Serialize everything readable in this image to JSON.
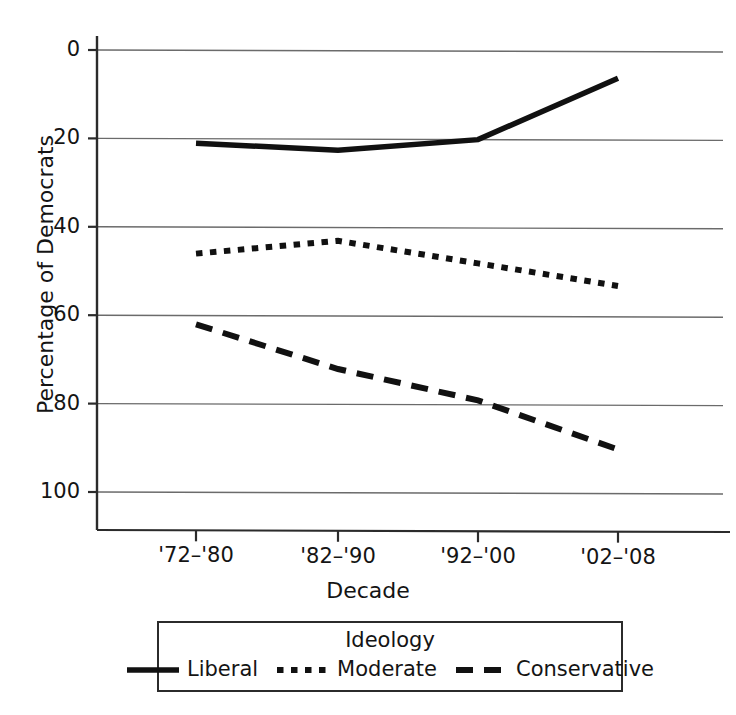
{
  "chart_data": {
    "type": "line",
    "title": "",
    "xlabel": "Decade",
    "ylabel": "Percentage of Democrats",
    "categories": [
      "'72–'80",
      "'82–'90",
      "'92–'00",
      "'02–'08"
    ],
    "ylim": [
      0,
      100
    ],
    "yticks": [
      0,
      20,
      40,
      60,
      80,
      100
    ],
    "ytick_labels": [
      "0",
      "20",
      "40",
      "60",
      "80",
      "100"
    ],
    "grid": "horizontal",
    "legend_position": "below-axis",
    "legend_title": "Ideology",
    "series": [
      {
        "name": "Liberal",
        "style": "solid",
        "color": "#111111",
        "values": [
          79,
          77.5,
          80,
          94
        ]
      },
      {
        "name": "Moderate",
        "style": "dotted",
        "color": "#111111",
        "values": [
          54,
          57,
          52,
          47
        ]
      },
      {
        "name": "Conservative",
        "style": "dashed",
        "color": "#111111",
        "values": [
          38,
          28,
          21,
          10
        ]
      }
    ]
  },
  "axes": {
    "y_title": "Percentage of Democrats",
    "x_title": "Decade",
    "y_ticks": [
      {
        "label": "100"
      },
      {
        "label": "80"
      },
      {
        "label": "60"
      },
      {
        "label": "40"
      },
      {
        "label": "20"
      },
      {
        "label": "0"
      }
    ],
    "x_ticks": [
      {
        "label": "'72–'80"
      },
      {
        "label": "'82–'90"
      },
      {
        "label": "'92–'00"
      },
      {
        "label": "'02–'08"
      }
    ]
  },
  "legend": {
    "title": "Ideology",
    "items": [
      {
        "label": "Liberal",
        "swatch": "solid-line-swatch"
      },
      {
        "label": "Moderate",
        "swatch": "dotted-line-swatch"
      },
      {
        "label": "Conservative",
        "swatch": "dashed-line-swatch"
      }
    ]
  },
  "colors": {
    "ink": "#111111",
    "grid": "#6b6b6b",
    "axis": "#2b2b2b",
    "background": "#ffffff"
  }
}
